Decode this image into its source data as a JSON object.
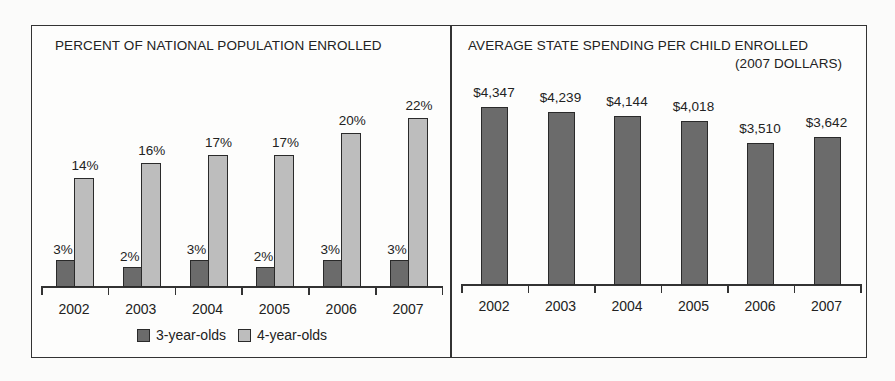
{
  "chart_data": [
    {
      "type": "bar",
      "title": "PERCENT OF NATIONAL POPULATION ENROLLED",
      "categories": [
        "2002",
        "2003",
        "2004",
        "2005",
        "2006",
        "2007"
      ],
      "series": [
        {
          "name": "3-year-olds",
          "values": [
            3,
            2,
            3,
            2,
            3,
            3
          ],
          "labels": [
            "3%",
            "2%",
            "3%",
            "2%",
            "3%",
            "3%"
          ],
          "color": "#6b6b6b"
        },
        {
          "name": "4-year-olds",
          "values": [
            14,
            16,
            17,
            17,
            20,
            22
          ],
          "labels": [
            "14%",
            "16%",
            "17%",
            "17%",
            "20%",
            "22%"
          ],
          "color": "#bdbdbd"
        }
      ],
      "xlabel": "",
      "ylabel": "",
      "grid": false,
      "legend_position": "bottom"
    },
    {
      "type": "bar",
      "title": "AVERAGE STATE SPENDING PER CHILD ENROLLED",
      "subtitle": "(2007 DOLLARS)",
      "categories": [
        "2002",
        "2003",
        "2004",
        "2005",
        "2006",
        "2007"
      ],
      "values": [
        4347,
        4239,
        4144,
        4018,
        3510,
        3642
      ],
      "labels": [
        "$4,347",
        "$4,239",
        "$4,144",
        "$4,018",
        "$3,510",
        "$3,642"
      ],
      "color": "#6b6b6b",
      "xlabel": "",
      "ylabel": "",
      "grid": false
    }
  ],
  "left": {
    "title": "PERCENT OF NATIONAL POPULATION ENROLLED",
    "years": [
      "2002",
      "2003",
      "2004",
      "2005",
      "2006",
      "2007"
    ],
    "three": [
      "3%",
      "2%",
      "3%",
      "2%",
      "3%",
      "3%"
    ],
    "four": [
      "14%",
      "16%",
      "17%",
      "17%",
      "20%",
      "22%"
    ],
    "legend": {
      "three": "3-year-olds",
      "four": "4-year-olds"
    }
  },
  "right": {
    "title": "AVERAGE STATE SPENDING PER CHILD ENROLLED",
    "subtitle": "(2007 DOLLARS)",
    "years": [
      "2002",
      "2003",
      "2004",
      "2005",
      "2006",
      "2007"
    ],
    "values": [
      "$4,347",
      "$4,239",
      "$4,144",
      "$4,018",
      "$3,510",
      "$3,642"
    ]
  }
}
